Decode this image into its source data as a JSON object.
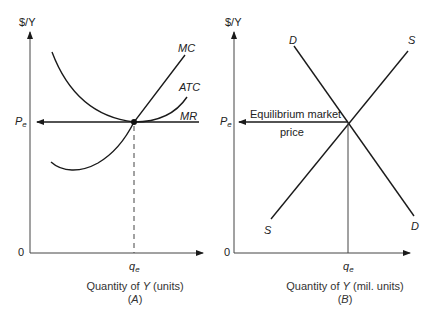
{
  "panel_a": {
    "y_axis_label": "$/Y",
    "origin_label": "0",
    "price_label": "P",
    "price_sub": "e",
    "quantity_label": "q",
    "quantity_sub": "e",
    "curves": {
      "mc": "MC",
      "atc": "ATC",
      "mr": "MR"
    },
    "x_axis_title": "Quantity of Y (units)",
    "x_axis_title_pre": "Quantity of ",
    "x_axis_title_var": "Y",
    "x_axis_title_post": " (units)",
    "panel_id": "(A)",
    "panel_id_pre": "(",
    "panel_id_letter": "A",
    "panel_id_post": ")"
  },
  "panel_b": {
    "y_axis_label": "$/Y",
    "origin_label": "0",
    "price_label": "P",
    "price_sub": "e",
    "quantity_label": "q",
    "quantity_sub": "e",
    "curves": {
      "demand_top": "D",
      "supply_top": "S",
      "supply_bottom": "S",
      "demand_bottom": "D"
    },
    "annotation_line1": "Equilibrium market",
    "annotation_line2": "price",
    "x_axis_title_pre": "Quantity of ",
    "x_axis_title_var": "Y",
    "x_axis_title_post": " (mil. units)",
    "panel_id_pre": "(",
    "panel_id_letter": "B",
    "panel_id_post": ")"
  },
  "colors": {
    "line": "#1a1a1a",
    "text": "#222222"
  }
}
